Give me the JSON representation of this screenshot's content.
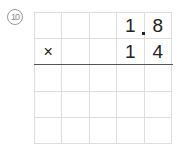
{
  "problem": {
    "number": "10",
    "grid": {
      "rows": 5,
      "cols": 5,
      "cells": [
        [
          "",
          "",
          "",
          "1",
          "8"
        ],
        [
          "×",
          "",
          "",
          "1",
          "4"
        ],
        [
          "",
          "",
          "",
          "",
          ""
        ],
        [
          "",
          "",
          "",
          "",
          ""
        ],
        [
          "",
          "",
          "",
          "",
          ""
        ]
      ]
    },
    "decimal_point": "."
  }
}
